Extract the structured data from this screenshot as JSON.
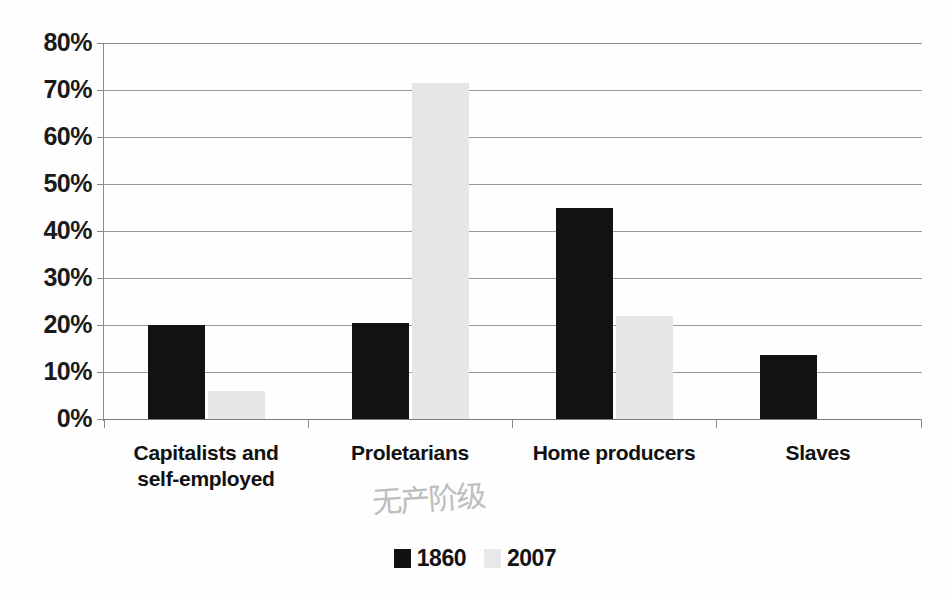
{
  "chart_data": {
    "type": "bar",
    "title": "",
    "subtitle": "",
    "xlabel": "",
    "ylabel": "",
    "ylim": [
      0,
      80
    ],
    "y_tick_labels": [
      "80%",
      "70%",
      "60%",
      "50%",
      "40%",
      "30%",
      "20%",
      "10%",
      "0%"
    ],
    "y_tick_values": [
      80,
      70,
      60,
      50,
      40,
      30,
      20,
      10,
      0
    ],
    "grid": true,
    "legend_position": "bottom",
    "categories": [
      "Capitalists and self-employed",
      "Proletarians",
      "Home producers",
      "Slaves"
    ],
    "category_lines": [
      [
        "Capitalists and",
        "self-employed"
      ],
      [
        "Proletarians"
      ],
      [
        "Home producers"
      ],
      [
        "Slaves"
      ]
    ],
    "series": [
      {
        "name": "1860",
        "color": "#121212",
        "values": [
          20.0,
          20.5,
          45.0,
          13.7
        ]
      },
      {
        "name": "2007",
        "color": "#e6e6e6",
        "values": [
          6.0,
          71.5,
          22.0,
          0
        ]
      }
    ],
    "annotations": [
      {
        "text": "无产阶级",
        "near_category": "Proletarians",
        "style": "handwritten-gray"
      }
    ]
  },
  "legend": {
    "items": [
      {
        "label": "1860",
        "swatch": "black-square"
      },
      {
        "label": "2007",
        "swatch": "light-gray-square"
      }
    ]
  },
  "colors": {
    "series_1860": "#121212",
    "series_2007": "#e6e6e6",
    "gridline": "#9a9a9a",
    "axis": "#8a8a8a",
    "text": "#111111",
    "annotation": "#b9b9b9",
    "background": "#ffffff"
  }
}
